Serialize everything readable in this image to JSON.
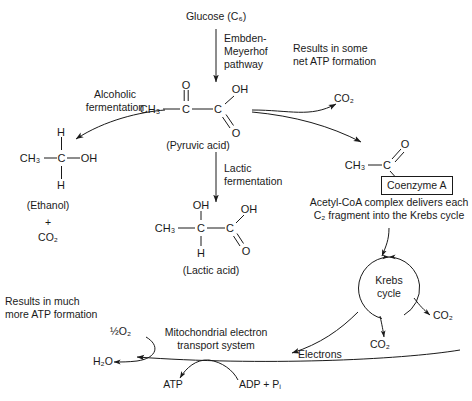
{
  "diagram": {
    "background_color": "#ffffff",
    "line_color": "#1a1a1a"
  },
  "nodes": {
    "glucose": "Glucose (C₆)",
    "embden_meyerhof": "Embden-\nMeyerhof\npathway",
    "results_some_atp": "Results in some\nnet ATP formation",
    "alcoholic_fermentation": "Alcoholic\nfermentation",
    "lactic_fermentation": "Lactic\nfermentation",
    "pyruvic_acid_caption": "(Pyruvic acid)",
    "lactic_acid_caption": "(Lactic acid)",
    "ethanol_caption": "(Ethanol)",
    "ethanol_plus": "+",
    "ethanol_co2": "CO₂",
    "co2_from_pyruvate": "CO₂",
    "coenzyme_a_box": "Coenzyme A",
    "acetyl_coa_caption": "Acetyl-CoA complex delivers each\nC₂ fragment into the Krebs cycle",
    "krebs_cycle": "Krebs\ncycle",
    "krebs_co2_right": "CO₂",
    "krebs_co2_bottom": "CO₂",
    "electrons": "Electrons",
    "results_much_atp": "Results in much\nmore ATP formation",
    "half_o2": "½O₂",
    "water": "H₂O",
    "mito_ets": "Mitochondrial electron\ntransport system",
    "atp": "ATP",
    "adp_pi": "ADP + Pᵢ"
  },
  "molecules": {
    "pyruvic_acid": {
      "name": "Pyruvic acid",
      "atoms": [
        "O",
        "OH",
        "CH₃",
        "C",
        "C",
        "O"
      ]
    },
    "ethanol": {
      "name": "Ethanol",
      "atoms": [
        "H",
        "CH₃",
        "C",
        "OH",
        "H"
      ]
    },
    "lactic_acid": {
      "name": "Lactic acid",
      "atoms": [
        "OH",
        "OH",
        "CH₃",
        "C",
        "C",
        "O",
        "H"
      ]
    },
    "acetyl_coa": {
      "name": "Acetyl-CoA",
      "atoms": [
        "O",
        "CH₃",
        "C"
      ]
    }
  }
}
